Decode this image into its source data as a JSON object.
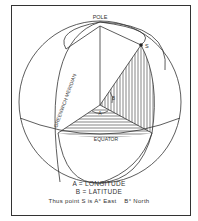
{
  "diagram": {
    "labels": {
      "pole": "POLE",
      "point": "S",
      "meridian": "GREENWICH MERIDIAN",
      "equator": "EQUATOR",
      "angle_a": "A",
      "angle_b": "B"
    },
    "legend": {
      "line1": "A = LONGITUDE",
      "line2": "B = LATITUDE",
      "line3_a": "Thus point S is A° East",
      "line3_b": "B° North"
    },
    "colors": {
      "ink": "#333333",
      "background": "#ffffff"
    }
  }
}
